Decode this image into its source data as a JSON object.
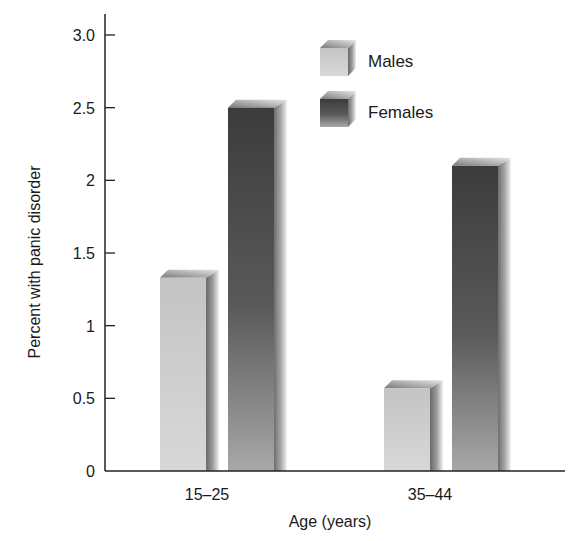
{
  "chart_data": {
    "type": "bar",
    "title": "",
    "xlabel": "Age (years)",
    "ylabel": "Percent with panic disorder",
    "categories": [
      "15–25",
      "35–44"
    ],
    "series": [
      {
        "name": "Males",
        "values": [
          1.33,
          0.57
        ],
        "color": "#c8c8c8"
      },
      {
        "name": "Females",
        "values": [
          2.5,
          2.1
        ],
        "color": "#4a4a4a"
      }
    ],
    "ylim": [
      0,
      3.0
    ],
    "yticks": [
      0,
      0.5,
      1,
      1.5,
      2,
      2.5,
      3.0
    ],
    "ytick_labels": [
      "0",
      "0.5",
      "1",
      "1.5",
      "2",
      "2.5",
      "3.0"
    ],
    "grid": false,
    "legend_position": "top-right",
    "style": "3d-bars"
  }
}
